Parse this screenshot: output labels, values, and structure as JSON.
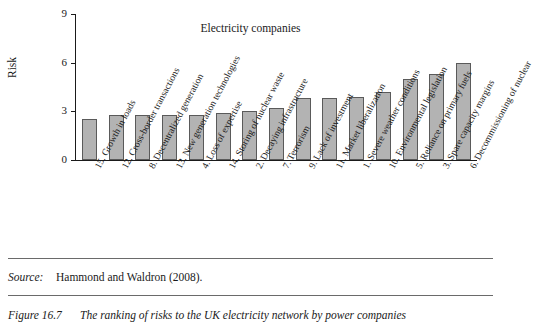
{
  "figure": {
    "source_label": "Source:",
    "source_text": "Hammond and Waldron (2008).",
    "caption_number": "Figure 16.7",
    "caption_text": "The ranking of risks to the UK electricity network by power companies"
  },
  "chart_data": {
    "type": "bar",
    "title": "Electricity companies",
    "xlabel": "",
    "ylabel": "Risk",
    "ylim": [
      0,
      9
    ],
    "yticks": [
      0,
      3,
      6,
      9
    ],
    "grid": false,
    "legend": "none",
    "bar_color": "#b3b3b3",
    "bar_edge_color": "#5a5a5a",
    "categories": [
      "15. Growth in loads",
      "12. Cross-border transactions",
      "8. Decentralized generation",
      "13. New generation technologies",
      "4. Loss of expertise",
      "14. Storing of nuclear waste",
      "2. Decaying infrastructure",
      "7. Terrorism",
      "9. Lack of investment",
      "11. Market liberalization",
      "1. Severe weather conditions",
      "10. Environmental legislation",
      "5. Reliance on primary fuels",
      "3. Spare capacity margins",
      "6. Decommissioning of nuclear"
    ],
    "values": [
      2.5,
      2.8,
      2.8,
      2.8,
      2.8,
      2.9,
      3.0,
      3.2,
      3.8,
      3.8,
      3.9,
      4.2,
      5.0,
      5.3,
      6.0
    ]
  }
}
